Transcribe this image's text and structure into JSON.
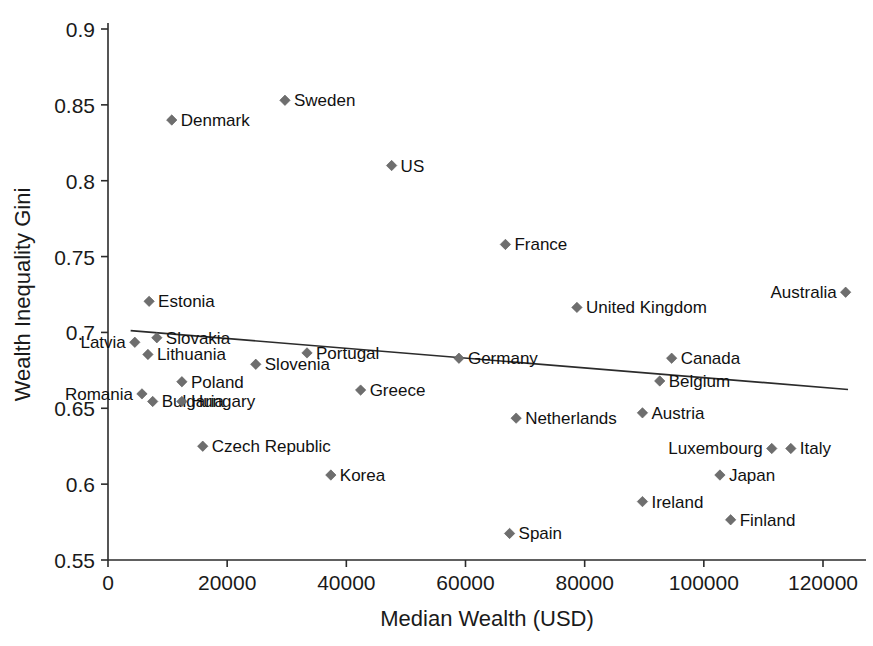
{
  "chart_data": {
    "type": "scatter",
    "title": "",
    "xlabel": "Median Wealth (USD)",
    "ylabel": "Wealth Inequality Gini",
    "xlim": [
      0,
      126000
    ],
    "ylim": [
      0.55,
      0.9
    ],
    "xticks": [
      0,
      20000,
      40000,
      60000,
      80000,
      100000,
      120000
    ],
    "xtick_labels": [
      "0",
      "20000",
      "40000",
      "60000",
      "80000",
      "100000",
      "120000"
    ],
    "yticks": [
      0.55,
      0.6,
      0.65,
      0.7,
      0.75,
      0.8,
      0.85,
      0.9
    ],
    "ytick_labels": [
      "0.55",
      "0.6",
      "0.65",
      "0.7",
      "0.75",
      "0.8",
      "0.85",
      "0.9"
    ],
    "grid": false,
    "legend": "none",
    "marker_color": "#6e6e6e",
    "line_color": "#2b2b2b",
    "trendline": {
      "label": "linear trend",
      "x_start": 3800,
      "y_start": 0.7012,
      "x_end": 124200,
      "y_end": 0.6624
    },
    "points": [
      {
        "label": "Denmark",
        "x": 10700,
        "y": 0.84,
        "label_side": "right"
      },
      {
        "label": "Sweden",
        "x": 29700,
        "y": 0.853,
        "label_side": "right"
      },
      {
        "label": "US",
        "x": 47600,
        "y": 0.81,
        "label_side": "right"
      },
      {
        "label": "France",
        "x": 66700,
        "y": 0.758,
        "label_side": "right"
      },
      {
        "label": "Australia",
        "x": 123800,
        "y": 0.7265,
        "label_side": "left"
      },
      {
        "label": "Estonia",
        "x": 6900,
        "y": 0.7205,
        "label_side": "right"
      },
      {
        "label": "United Kingdom",
        "x": 78700,
        "y": 0.7165,
        "label_side": "right"
      },
      {
        "label": "Slovakia",
        "x": 8200,
        "y": 0.6965,
        "label_side": "right"
      },
      {
        "label": "Latvia",
        "x": 4500,
        "y": 0.6935,
        "label_side": "left"
      },
      {
        "label": "Lithuania",
        "x": 6700,
        "y": 0.6855,
        "label_side": "right"
      },
      {
        "label": "Portugal",
        "x": 33400,
        "y": 0.6865,
        "label_side": "right"
      },
      {
        "label": "Germany",
        "x": 58900,
        "y": 0.683,
        "label_side": "right"
      },
      {
        "label": "Canada",
        "x": 94600,
        "y": 0.683,
        "label_side": "right"
      },
      {
        "label": "Slovenia",
        "x": 24800,
        "y": 0.679,
        "label_side": "right"
      },
      {
        "label": "Poland",
        "x": 12400,
        "y": 0.6675,
        "label_side": "right"
      },
      {
        "label": "Belgium",
        "x": 92600,
        "y": 0.668,
        "label_side": "right"
      },
      {
        "label": "Greece",
        "x": 42400,
        "y": 0.662,
        "label_side": "right"
      },
      {
        "label": "Romania",
        "x": 5700,
        "y": 0.6595,
        "label_side": "left"
      },
      {
        "label": "Bulgaria",
        "x": 7500,
        "y": 0.6545,
        "label_side": "right"
      },
      {
        "label": "Hungary",
        "x": 12400,
        "y": 0.6545,
        "label_side": "right"
      },
      {
        "label": "Austria",
        "x": 89700,
        "y": 0.647,
        "label_side": "right"
      },
      {
        "label": "Netherlands",
        "x": 68500,
        "y": 0.6435,
        "label_side": "right"
      },
      {
        "label": "Luxembourg",
        "x": 111400,
        "y": 0.6235,
        "label_side": "left"
      },
      {
        "label": "Italy",
        "x": 114600,
        "y": 0.6235,
        "label_side": "right"
      },
      {
        "label": "Czech Republic",
        "x": 15900,
        "y": 0.625,
        "label_side": "right"
      },
      {
        "label": "Japan",
        "x": 102700,
        "y": 0.606,
        "label_side": "right"
      },
      {
        "label": "Korea",
        "x": 37400,
        "y": 0.606,
        "label_side": "right"
      },
      {
        "label": "Ireland",
        "x": 89700,
        "y": 0.5885,
        "label_side": "right"
      },
      {
        "label": "Finland",
        "x": 104500,
        "y": 0.5765,
        "label_side": "right"
      },
      {
        "label": "Spain",
        "x": 67400,
        "y": 0.5675,
        "label_side": "right"
      }
    ]
  }
}
